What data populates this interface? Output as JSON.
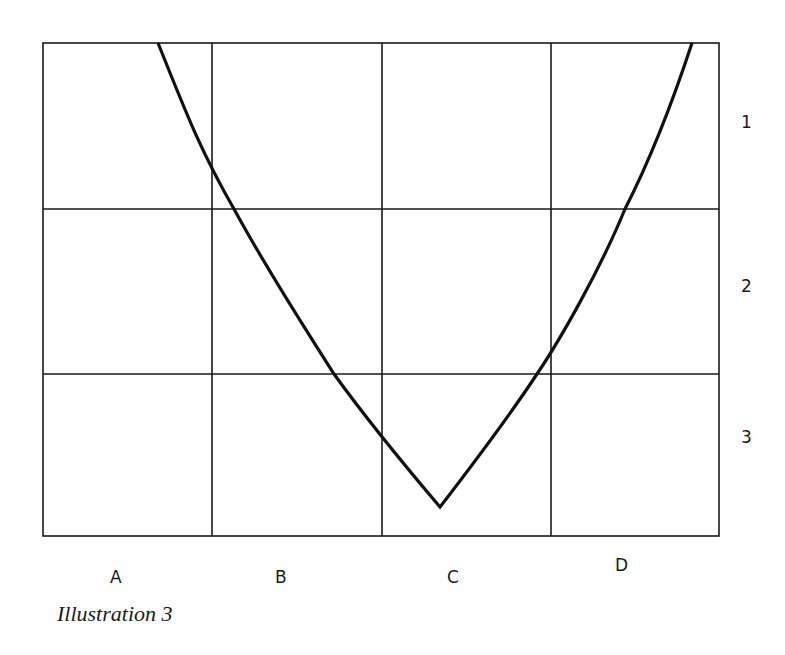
{
  "header_fragment": "",
  "grid": {
    "columns": [
      "A",
      "B",
      "C",
      "D"
    ],
    "rows": [
      "1",
      "2",
      "3"
    ]
  },
  "caption": "Illustration 3",
  "colors": {
    "ink": "#1a1a1a",
    "background": "#ffffff"
  }
}
